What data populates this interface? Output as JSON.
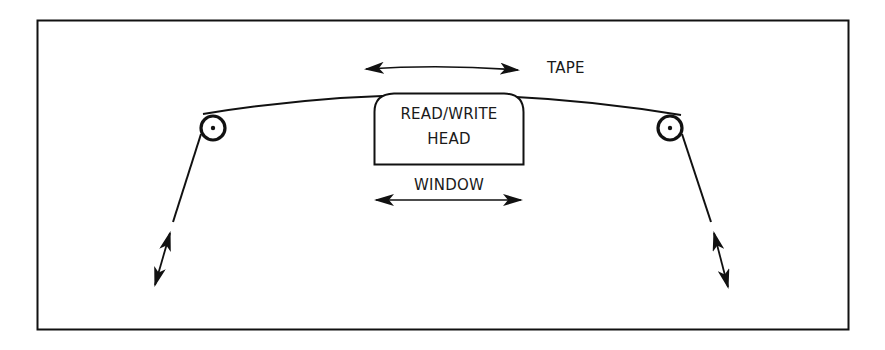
{
  "diagram": {
    "labels": {
      "tape": "TAPE",
      "head_line1": "READ/WRITE",
      "head_line2": "HEAD",
      "window": "WINDOW"
    },
    "elements": [
      {
        "id": "frame",
        "type": "border-rectangle"
      },
      {
        "id": "tape",
        "type": "curved-line",
        "label": "TAPE"
      },
      {
        "id": "tape-motion-arrow",
        "type": "double-headed-arrow",
        "direction": "horizontal"
      },
      {
        "id": "read-write-head",
        "type": "rounded-box",
        "label": "READ/WRITE HEAD"
      },
      {
        "id": "window-arrow",
        "type": "double-headed-arrow",
        "direction": "horizontal",
        "label": "WINDOW"
      },
      {
        "id": "left-roller",
        "type": "circle-with-center-dot"
      },
      {
        "id": "right-roller",
        "type": "circle-with-center-dot"
      },
      {
        "id": "left-tension-arrow",
        "type": "double-headed-arrow",
        "direction": "diagonal"
      },
      {
        "id": "right-tension-arrow",
        "type": "double-headed-arrow",
        "direction": "diagonal"
      }
    ],
    "colors": {
      "stroke": "#111111",
      "background": "#ffffff"
    }
  }
}
